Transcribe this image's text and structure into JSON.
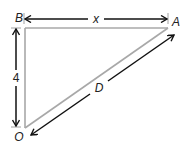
{
  "diagram": {
    "type": "right-triangle",
    "vertices": {
      "top_left": "B",
      "top_right": "A",
      "bottom_left": "O"
    },
    "dimensions": {
      "top": "x",
      "left": "4",
      "hypotenuse": "D"
    },
    "colors": {
      "triangle_stroke": "#a8a8a8",
      "arrow_stroke": "#111111",
      "text": "#222222"
    }
  }
}
